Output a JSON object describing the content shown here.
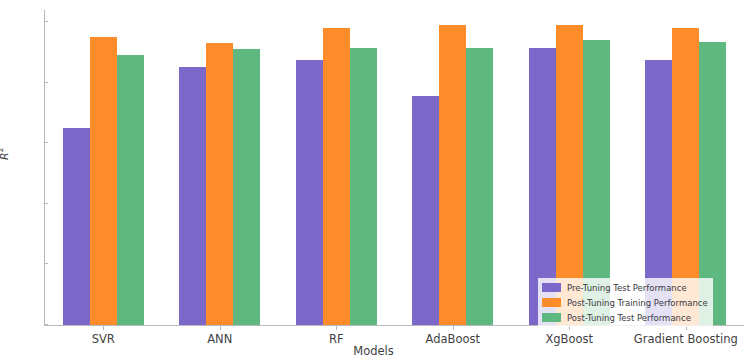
{
  "chart_data": {
    "type": "bar",
    "title": "",
    "xlabel": "Models",
    "ylabel": "R²",
    "categories": [
      "SVR",
      "ANN",
      "RF",
      "AdaBoost",
      "XgBoost",
      "Gradient Boosting"
    ],
    "series": [
      {
        "name": "Pre-Tuning Test Performance",
        "color": "#7b68c8",
        "values": [
          0.65,
          0.85,
          0.875,
          0.755,
          0.915,
          0.875
        ]
      },
      {
        "name": "Post-Tuning Training Performance",
        "color": "#ff8c2b",
        "values": [
          0.95,
          0.93,
          0.98,
          0.99,
          0.99,
          0.98
        ]
      },
      {
        "name": "Post-Tuning Test Performance",
        "color": "#5fb87f",
        "values": [
          0.89,
          0.91,
          0.915,
          0.915,
          0.94,
          0.935
        ]
      }
    ],
    "ylim": [
      0.0,
      1.0
    ],
    "yticks": [
      "0.0",
      "0.2",
      "0.4",
      "0.6",
      "0.8",
      "1.0"
    ],
    "ytick_values": [
      0.0,
      0.2,
      0.4,
      0.6,
      0.8,
      1.0
    ],
    "grid": false,
    "legend_position": "lower right"
  },
  "axes": {
    "ylabel": "R",
    "ylabel_exponent": "2",
    "xlabel": "Models"
  },
  "legend": {
    "entries": [
      "Pre-Tuning Test Performance",
      "Post-Tuning Training Performance",
      "Post-Tuning Test Performance"
    ]
  }
}
